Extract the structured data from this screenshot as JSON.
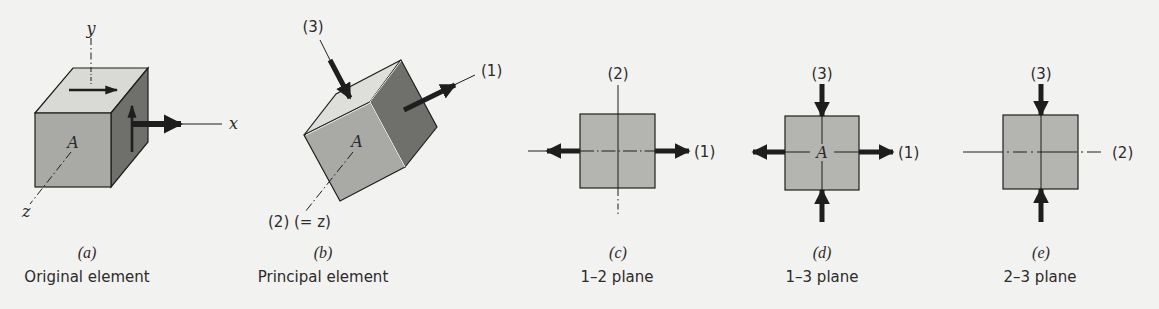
{
  "figure": {
    "colors": {
      "background": "#f2f2f0",
      "face_light": "#d9d9d6",
      "face_mid": "#a9a9a6",
      "face_dark": "#6f6f6c",
      "square_fill": "#b4b4b1",
      "ink": "#1e1e1e"
    },
    "panels": [
      {
        "id": "a",
        "letter": "(a)",
        "caption": "Original element",
        "point_label": "A",
        "axis_labels": {
          "x": "x",
          "y": "y",
          "z": "z"
        }
      },
      {
        "id": "b",
        "letter": "(b)",
        "caption": "Principal element",
        "point_label": "A",
        "axis_labels": {
          "one": "(1)",
          "two": "(2) (= z)",
          "three": "(3)"
        }
      },
      {
        "id": "c",
        "letter": "(c)",
        "caption": "1–2 plane",
        "axis_labels": {
          "horizontal": "(1)",
          "vertical": "(2)"
        }
      },
      {
        "id": "d",
        "letter": "(d)",
        "caption": "1–3 plane",
        "point_label": "A",
        "axis_labels": {
          "horizontal": "(1)",
          "vertical": "(3)"
        }
      },
      {
        "id": "e",
        "letter": "(e)",
        "caption": "2–3 plane",
        "axis_labels": {
          "horizontal": "(2)",
          "vertical": "(3)"
        }
      }
    ]
  }
}
